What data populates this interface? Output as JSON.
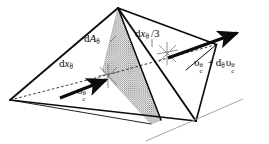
{
  "figure": {
    "background_color": "#ffffff",
    "ink_color": "#0b0b0b",
    "hatch_color": "#8a8a8a",
    "dashed_color": "#1a1a1a",
    "tangent_line_color": "#9a9a9a",
    "labels": {
      "area": {
        "base": "d",
        "symbol": "A",
        "subscript": "θ",
        "full": "dAθ"
      },
      "edge_left": {
        "base": "d",
        "symbol": "x",
        "subscript": "θ",
        "full": "dxθ"
      },
      "edge_third": {
        "base": "d",
        "symbol": "x",
        "subscript": "θ",
        "divisor": "/3",
        "full": "dxθ /3"
      },
      "velocity_in": {
        "symbol": "υ",
        "subscript": "c",
        "superscript": "θ",
        "full": "υcθ"
      },
      "velocity_out": {
        "symbol": "υ",
        "subscript": "c",
        "superscript": "θ",
        "operator": "+",
        "operator_symbol": "d",
        "operator_subscript": "θ",
        "full": "υcθ + dθ υcθ"
      }
    },
    "geometry": {
      "vertices": {
        "apex_top": [
          118,
          8
        ],
        "left": [
          10,
          100
        ],
        "bottom_right": [
          186,
          126
        ],
        "right_back": [
          217,
          44
        ],
        "front_bottom": [
          196,
          121
        ]
      },
      "centroid_markers": [
        {
          "name": "centroid-near",
          "x": 108,
          "y": 74,
          "rays": 6
        },
        {
          "name": "centroid-far",
          "x": 167,
          "y": 52,
          "rays": 6
        }
      ],
      "arrows": [
        {
          "name": "velocity-in-arrow",
          "from": [
            62,
            97
          ],
          "to": [
            110,
            79
          ]
        },
        {
          "name": "velocity-out-arrow",
          "from": [
            170,
            57
          ],
          "to": [
            240,
            33
          ]
        }
      ],
      "shaded_region": {
        "name": "cross-section-dA-theta",
        "points": [
          [
            118,
            8
          ],
          [
            103,
            70
          ],
          [
            152,
            123
          ],
          [
            160,
            120
          ]
        ],
        "fill": "hatch"
      },
      "tangent_line": {
        "from": [
          148,
          140
        ],
        "to": [
          242,
          100
        ]
      }
    }
  }
}
